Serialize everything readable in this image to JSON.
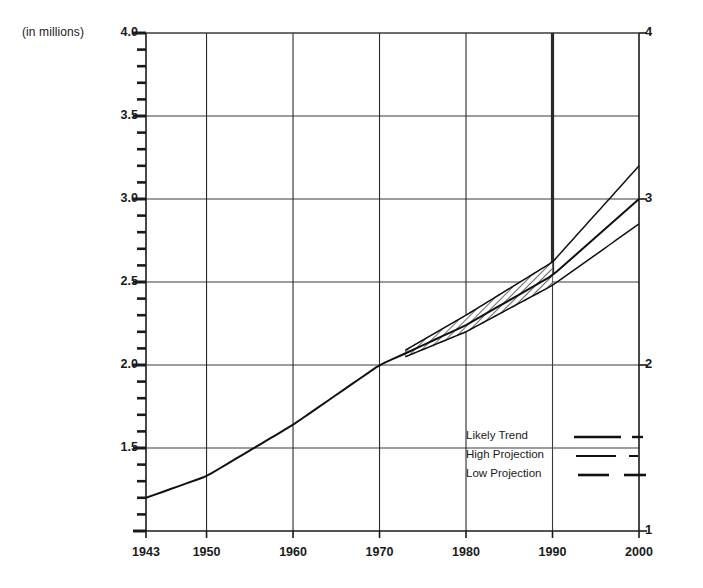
{
  "chart_data": {
    "type": "line",
    "title": "",
    "subtitle": "",
    "units_label": "(in millions)",
    "xlabel": "",
    "ylabel": "",
    "xlim": [
      1943,
      2000
    ],
    "ylim": [
      1.0,
      4.0
    ],
    "grid": true,
    "x_ticks": [
      1943,
      1950,
      1960,
      1970,
      1980,
      1990,
      2000
    ],
    "x_tick_labels": [
      "1943",
      "1950",
      "1960",
      "1970",
      "1980",
      "1990",
      "2000"
    ],
    "y_ticks_left": [
      1.5,
      2.0,
      2.5,
      3.0,
      3.5,
      4.0
    ],
    "y_tick_labels_left": [
      "1.5",
      "2.0",
      "2.5",
      "3.0",
      "3.5",
      "4.0"
    ],
    "y_ticks_right": [
      1,
      2,
      3,
      4
    ],
    "y_tick_labels_right": [
      "1",
      "2",
      "3",
      "4"
    ],
    "y_minor_tick_step": 0.1,
    "gridlines_y": [
      1.5,
      2.0,
      2.5,
      3.0,
      3.5,
      4.0
    ],
    "gridlines_x": [
      1950,
      1960,
      1970,
      1980,
      1990
    ],
    "projection_start_year": 1990,
    "uncertainty_band_start_year": 1973,
    "uncertainty_band_end_year": 1990,
    "legend_position": "inside-lower-right",
    "series": [
      {
        "name": "Likely Trend",
        "style": "solid-with-dash-tail",
        "points": [
          {
            "x": 1943,
            "y": 1.2
          },
          {
            "x": 1950,
            "y": 1.33
          },
          {
            "x": 1960,
            "y": 1.64
          },
          {
            "x": 1970,
            "y": 2.0
          },
          {
            "x": 1973,
            "y": 2.07
          },
          {
            "x": 1980,
            "y": 2.24
          },
          {
            "x": 1990,
            "y": 2.54
          },
          {
            "x": 2000,
            "y": 3.0
          }
        ]
      },
      {
        "name": "High Projection",
        "style": "solid-with-short-dash-tail",
        "points": [
          {
            "x": 1973,
            "y": 2.09
          },
          {
            "x": 1980,
            "y": 2.3
          },
          {
            "x": 1990,
            "y": 2.62
          },
          {
            "x": 2000,
            "y": 3.2
          }
        ]
      },
      {
        "name": "Low Projection",
        "style": "long-dash",
        "points": [
          {
            "x": 1973,
            "y": 2.05
          },
          {
            "x": 1980,
            "y": 2.2
          },
          {
            "x": 1990,
            "y": 2.48
          },
          {
            "x": 2000,
            "y": 2.85
          }
        ]
      }
    ],
    "legend_entries": [
      {
        "label": "Likely Trend"
      },
      {
        "label": "High Projection"
      },
      {
        "label": "Low Projection"
      }
    ]
  }
}
